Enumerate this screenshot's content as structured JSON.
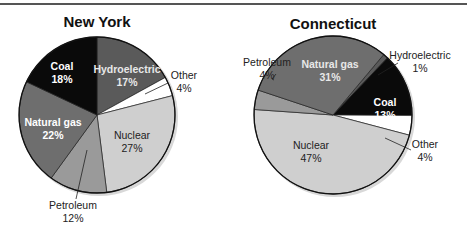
{
  "chart_data": [
    {
      "type": "pie",
      "title": "New York",
      "start_angle_deg": 0,
      "direction": "clockwise",
      "slices": [
        {
          "label": "Hydroelectric",
          "value": 17,
          "display": "17%",
          "color": "#5a5a5a",
          "text_color": "#ffffff"
        },
        {
          "label": "Other",
          "value": 4,
          "display": "4%",
          "color": "#ffffff",
          "text_color": "#222222",
          "outside": true
        },
        {
          "label": "Nuclear",
          "value": 27,
          "display": "27%",
          "color": "#cfcfcf",
          "text_color": "#222222"
        },
        {
          "label": "Petroleum",
          "value": 12,
          "display": "12%",
          "color": "#9a9a9a",
          "text_color": "#222222",
          "outside": true
        },
        {
          "label": "Natural gas",
          "value": 22,
          "display": "22%",
          "color": "#6e6e6e",
          "text_color": "#ffffff"
        },
        {
          "label": "Coal",
          "value": 18,
          "display": "18%",
          "color": "#0a0a0a",
          "text_color": "#ffffff"
        }
      ]
    },
    {
      "type": "pie",
      "title": "Connecticut",
      "start_angle_deg": 40,
      "direction": "clockwise",
      "slices": [
        {
          "label": "Hydroelectric",
          "value": 1,
          "display": "1%",
          "color": "#5a5a5a",
          "text_color": "#222222",
          "outside": true
        },
        {
          "label": "Coal",
          "value": 13,
          "display": "13%",
          "color": "#0a0a0a",
          "text_color": "#ffffff"
        },
        {
          "label": "Other",
          "value": 4,
          "display": "4%",
          "color": "#ffffff",
          "text_color": "#222222",
          "outside": true
        },
        {
          "label": "Nuclear",
          "value": 47,
          "display": "47%",
          "color": "#cfcfcf",
          "text_color": "#222222"
        },
        {
          "label": "Petroleum",
          "value": 4,
          "display": "4%",
          "color": "#9a9a9a",
          "text_color": "#222222",
          "outside": true
        },
        {
          "label": "Natural gas",
          "value": 31,
          "display": "31%",
          "color": "#6e6e6e",
          "text_color": "#ffffff"
        }
      ]
    }
  ]
}
